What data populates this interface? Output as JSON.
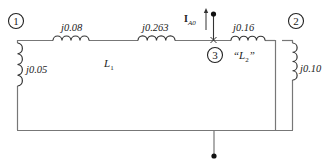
{
  "diagram": {
    "nodes": [
      {
        "id": "1",
        "label": "1"
      },
      {
        "id": "2",
        "label": "2"
      },
      {
        "id": "3",
        "label": "3"
      }
    ],
    "impedances": {
      "z1_shunt": "j0.05",
      "z1_series": "j0.08",
      "z_mid": "j0.263",
      "z3_series": "j0.16",
      "z2_shunt": "j0.10"
    },
    "line_labels": {
      "l1": "L",
      "l1_sub": "1",
      "l2_open": "“L",
      "l2_sub": "2",
      "l2_close": "”"
    },
    "current": {
      "symbol": "I",
      "subscript": "A0"
    },
    "colors": {
      "wire": "#777777",
      "coil": "#333333",
      "text": "#222222"
    }
  }
}
